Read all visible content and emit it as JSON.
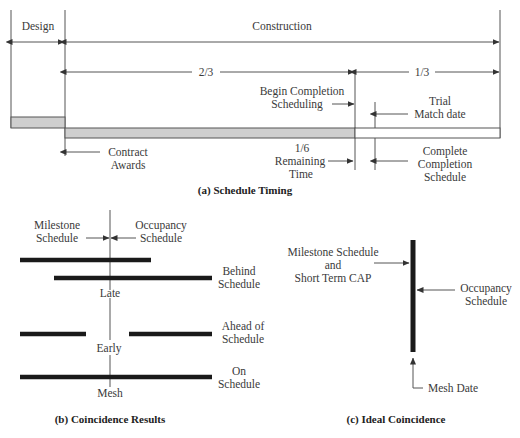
{
  "panel_a": {
    "caption": "(a) Schedule Timing",
    "design_label": "Design",
    "construction_label": "Construction",
    "two_thirds": "2/3",
    "one_third": "1/3",
    "begin_completion_1": "Begin Completion",
    "begin_completion_2": "Scheduling",
    "trial_1": "Trial",
    "trial_2": "Match date",
    "contract_1": "Contract",
    "contract_2": "Awards",
    "remaining_1": "1/6",
    "remaining_2": "Remaining",
    "remaining_3": "Time",
    "complete_1": "Complete",
    "complete_2": "Completion",
    "complete_3": "Schedule"
  },
  "panel_b": {
    "caption": "(b) Coincidence Results",
    "milestone_1": "Milestone",
    "milestone_2": "Schedule",
    "occupancy_1": "Occupancy",
    "occupancy_2": "Schedule",
    "late": "Late",
    "early": "Early",
    "mesh": "Mesh",
    "behind_1": "Behind",
    "behind_2": "Schedule",
    "ahead_1": "Ahead of",
    "ahead_2": "Schedule",
    "on_1": "On",
    "on_2": "Schedule"
  },
  "panel_c": {
    "caption": "(c) Ideal Coincidence",
    "milestone_1": "Milestone Schedule",
    "milestone_2": "and",
    "milestone_3": "Short Term CAP",
    "occupancy_1": "Occupancy",
    "occupancy_2": "Schedule",
    "mesh_date": "Mesh Date"
  }
}
